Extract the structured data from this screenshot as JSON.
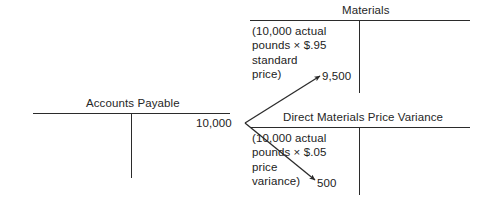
{
  "diagram": {
    "type": "t-account-flow",
    "accounts": [
      {
        "id": "materials",
        "title": "Materials",
        "side": "debit",
        "note": "(10,000 actual\npounds × $.95\nstandard\nprice)",
        "amount": "9,500"
      },
      {
        "id": "accounts-payable",
        "title": "Accounts Payable",
        "side": "credit",
        "note": "",
        "amount": "10,000"
      },
      {
        "id": "direct-materials-price-variance",
        "title": "Direct Materials Price Variance",
        "side": "debit",
        "note": "(10,000 actual\npounds × $.05\nprice\nvariance)",
        "amount": "500"
      }
    ],
    "flows": [
      {
        "from": "accounts-payable",
        "to": "materials",
        "amount": "9,500"
      },
      {
        "from": "accounts-payable",
        "to": "direct-materials-price-variance",
        "amount": "500"
      }
    ],
    "colors": {
      "rule": "#2b2b2b",
      "text": "#222222",
      "background": "#ffffff"
    }
  }
}
